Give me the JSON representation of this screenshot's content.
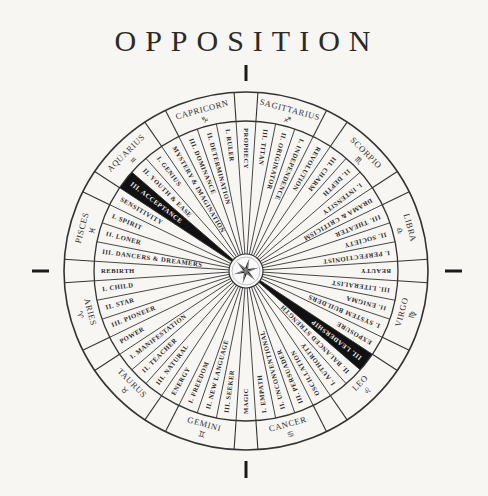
{
  "title": "OPPOSITION",
  "colors": {
    "background": "#f7f6f3",
    "line": "#333333",
    "highlight": "#111111",
    "highlight_text": "#f2f2f2"
  },
  "center_icon": "compass-star-icon",
  "axis_marks": [
    "top",
    "right",
    "bottom",
    "left"
  ],
  "highlighted_opposition": [
    "III. ACCEPTANCE",
    "III. LEADERSHIP"
  ],
  "spokes": [
    {
      "label": "PROPHECY",
      "type": "cusp"
    },
    {
      "label": "III. TITAN",
      "sign": "Sagittarius"
    },
    {
      "label": "II. ORIGINATOR",
      "sign": "Sagittarius"
    },
    {
      "label": "I. INDEPENDENCE",
      "sign": "Sagittarius"
    },
    {
      "label": "REVOLUTION",
      "type": "cusp"
    },
    {
      "label": "III. CHARM",
      "sign": "Scorpio"
    },
    {
      "label": "II. DEPTH",
      "sign": "Scorpio"
    },
    {
      "label": "I. INTENSITY",
      "sign": "Scorpio"
    },
    {
      "label": "DRAMA & CRITICISM",
      "type": "cusp"
    },
    {
      "label": "III. THEATER",
      "sign": "Libra"
    },
    {
      "label": "II. SOCIETY",
      "sign": "Libra"
    },
    {
      "label": "I. PERFECTIONIST",
      "sign": "Libra"
    },
    {
      "label": "BEAUTY",
      "type": "cusp"
    },
    {
      "label": "III. LITERALIST",
      "sign": "Virgo"
    },
    {
      "label": "II. ENIGMA",
      "sign": "Virgo"
    },
    {
      "label": "I. SYSTEM BUILDERS",
      "sign": "Virgo"
    },
    {
      "label": "EXPOSURE",
      "type": "cusp"
    },
    {
      "label": "III. LEADERSHIP",
      "sign": "Leo",
      "highlight": true
    },
    {
      "label": "II. BALANCED STRENGTH",
      "sign": "Leo"
    },
    {
      "label": "I. AUTHORITY",
      "sign": "Leo"
    },
    {
      "label": "OSCILLATION",
      "type": "cusp"
    },
    {
      "label": "III. PERSUADER",
      "sign": "Cancer"
    },
    {
      "label": "II. UNCONVENTIONAL",
      "sign": "Cancer"
    },
    {
      "label": "I. EMPATH",
      "sign": "Cancer"
    },
    {
      "label": "MAGIC",
      "type": "cusp"
    },
    {
      "label": "III. SEEKER",
      "sign": "Gemini"
    },
    {
      "label": "II. NEW LANGUAGE",
      "sign": "Gemini"
    },
    {
      "label": "I. FREEDOM",
      "sign": "Gemini"
    },
    {
      "label": "ENERGY",
      "type": "cusp"
    },
    {
      "label": "III. NATURAL",
      "sign": "Taurus"
    },
    {
      "label": "II. TEACHER",
      "sign": "Taurus"
    },
    {
      "label": "I. MANIFESTATION",
      "sign": "Taurus"
    },
    {
      "label": "POWER",
      "type": "cusp"
    },
    {
      "label": "III. PIONEER",
      "sign": "Aries"
    },
    {
      "label": "II. STAR",
      "sign": "Aries"
    },
    {
      "label": "I. CHILD",
      "sign": "Aries"
    },
    {
      "label": "REBIRTH",
      "type": "cusp"
    },
    {
      "label": "III. DANCERS & DREAMERS",
      "sign": "Pisces"
    },
    {
      "label": "II. LONER",
      "sign": "Pisces"
    },
    {
      "label": "I. SPIRIT",
      "sign": "Pisces"
    },
    {
      "label": "SENSITIVITY",
      "type": "cusp"
    },
    {
      "label": "III. ACCEPTANCE",
      "sign": "Aquarius",
      "highlight": true
    },
    {
      "label": "II. YOUTH & EASE",
      "sign": "Aquarius"
    },
    {
      "label": "I. GENIUS",
      "sign": "Aquarius"
    },
    {
      "label": "MYSTERY & IMAGINATION",
      "type": "cusp"
    },
    {
      "label": "III. DOMINANCE",
      "sign": "Capricorn"
    },
    {
      "label": "II. DETERMINATION",
      "sign": "Capricorn"
    },
    {
      "label": "I. RULER",
      "sign": "Capricorn"
    }
  ],
  "signs": [
    {
      "name": "SAGITTARIUS",
      "glyph": "♐"
    },
    {
      "name": "SCORPIO",
      "glyph": "♏"
    },
    {
      "name": "LIBRA",
      "glyph": "♎"
    },
    {
      "name": "VIRGO",
      "glyph": "♍"
    },
    {
      "name": "LEO",
      "glyph": "♌"
    },
    {
      "name": "CANCER",
      "glyph": "♋"
    },
    {
      "name": "GEMINI",
      "glyph": "♊"
    },
    {
      "name": "TAURUS",
      "glyph": "♉"
    },
    {
      "name": "ARIES",
      "glyph": "♈"
    },
    {
      "name": "PISCES",
      "glyph": "♓"
    },
    {
      "name": "AQUARIUS",
      "glyph": "♒"
    },
    {
      "name": "CAPRICORN",
      "glyph": "♑"
    }
  ]
}
